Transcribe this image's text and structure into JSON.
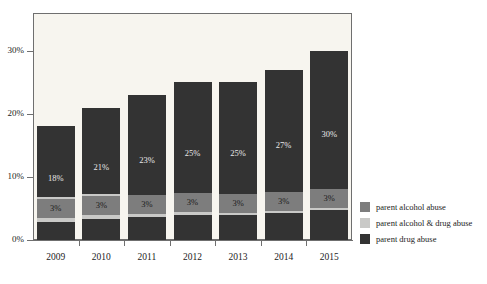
{
  "chart_data": {
    "type": "bar",
    "subtype": "stacked-bar",
    "title": "",
    "subtitle": "",
    "xlabel": "",
    "ylabel": "",
    "categories": [
      "2009",
      "2010",
      "2011",
      "2012",
      "2013",
      "2014",
      "2015"
    ],
    "ylim": [
      0,
      36
    ],
    "yticks": [
      0,
      10,
      20,
      30
    ],
    "ytick_labels": [
      "0%",
      "10%",
      "20%",
      "30%"
    ],
    "grid": false,
    "legend_position": "right-bottom",
    "series": [
      {
        "name": "parent drug abuse",
        "color": "#333333",
        "values": [
          18,
          21,
          23,
          25,
          25,
          27,
          30
        ],
        "labels": [
          "18%",
          "21%",
          "23%",
          "25%",
          "25%",
          "27%",
          "30%"
        ]
      },
      {
        "name": "parent alcohol & drug abuse",
        "color": "#c9c9c7",
        "values": [
          4,
          4,
          3,
          3,
          2,
          2,
          2
        ],
        "labels": [
          "4%",
          "4%",
          "3%",
          "3%",
          "2%",
          "2%",
          "2%"
        ]
      },
      {
        "name": "parent alcohol abuse",
        "color": "#7d7d7d",
        "values": [
          3,
          3,
          3,
          3,
          3,
          3,
          3
        ],
        "labels": [
          "3%",
          "3%",
          "3%",
          "3%",
          "3%",
          "3%",
          "3%"
        ]
      }
    ],
    "totals": [
      25,
      28,
      29,
      31,
      30,
      32,
      35
    ],
    "colors": {
      "plot_background": "#f7f5ef",
      "frame": "#6f6f6f",
      "axis_text": "#1b1b1b",
      "series_dark": "#333333",
      "series_light": "#c9c9c7",
      "series_medium": "#7d7d7d"
    }
  },
  "yaxis": {
    "labels": [
      "30%",
      "20%",
      "10%",
      "0%"
    ]
  },
  "xaxis": {
    "labels": [
      "2009",
      "2010",
      "2011",
      "2012",
      "2013",
      "2014",
      "2015"
    ]
  },
  "legend": {
    "items": [
      {
        "label": "parent alcohol abuse",
        "color": "#7d7d7d"
      },
      {
        "label": "parent alcohol & drug abuse",
        "color": "#c9c9c7"
      },
      {
        "label": "parent drug abuse",
        "color": "#333333"
      }
    ]
  },
  "bars": [
    {
      "category": "2009",
      "segments": [
        {
          "series": "parent drug abuse",
          "label": "18%",
          "value": 18
        },
        {
          "series": "parent alcohol & drug abuse",
          "label": "4%",
          "value": 4
        },
        {
          "series": "parent alcohol abuse",
          "label": "3%",
          "value": 3
        }
      ]
    },
    {
      "category": "2010",
      "segments": [
        {
          "series": "parent drug abuse",
          "label": "21%",
          "value": 21
        },
        {
          "series": "parent alcohol & drug abuse",
          "label": "4%",
          "value": 4
        },
        {
          "series": "parent alcohol abuse",
          "label": "3%",
          "value": 3
        }
      ]
    },
    {
      "category": "2011",
      "segments": [
        {
          "series": "parent drug abuse",
          "label": "23%",
          "value": 23
        },
        {
          "series": "parent alcohol & drug abuse",
          "label": "3%",
          "value": 3
        },
        {
          "series": "parent alcohol abuse",
          "label": "3%",
          "value": 3
        }
      ]
    },
    {
      "category": "2012",
      "segments": [
        {
          "series": "parent drug abuse",
          "label": "25%",
          "value": 25
        },
        {
          "series": "parent alcohol & drug abuse",
          "label": "3%",
          "value": 3
        },
        {
          "series": "parent alcohol abuse",
          "label": "3%",
          "value": 3
        }
      ]
    },
    {
      "category": "2013",
      "segments": [
        {
          "series": "parent drug abuse",
          "label": "25%",
          "value": 25
        },
        {
          "series": "parent alcohol & drug abuse",
          "label": "2%",
          "value": 2
        },
        {
          "series": "parent alcohol abuse",
          "label": "3%",
          "value": 3
        }
      ]
    },
    {
      "category": "2014",
      "segments": [
        {
          "series": "parent drug abuse",
          "label": "27%",
          "value": 27
        },
        {
          "series": "parent alcohol & drug abuse",
          "label": "2%",
          "value": 2
        },
        {
          "series": "parent alcohol abuse",
          "label": "3%",
          "value": 3
        }
      ]
    },
    {
      "category": "2015",
      "segments": [
        {
          "series": "parent drug abuse",
          "label": "30%",
          "value": 30
        },
        {
          "series": "parent alcohol & drug abuse",
          "label": "2%",
          "value": 2
        },
        {
          "series": "parent alcohol abuse",
          "label": "3%",
          "value": 3
        }
      ]
    }
  ]
}
